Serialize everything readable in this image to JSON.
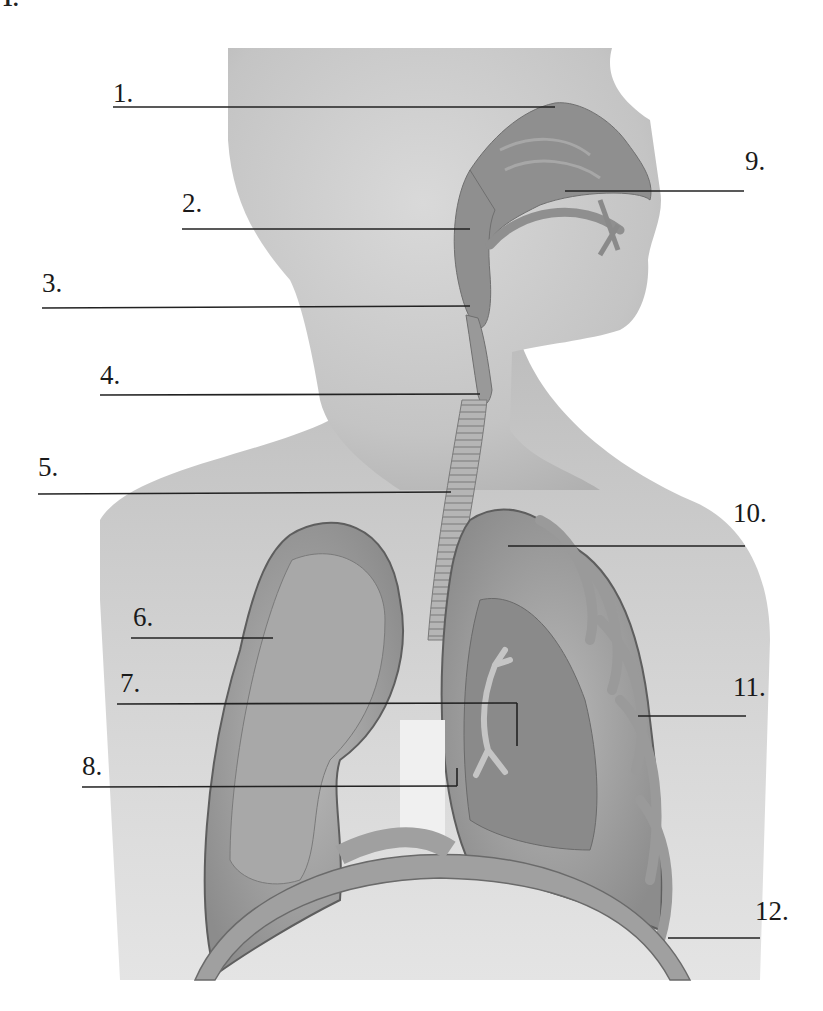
{
  "diagram": {
    "corner_mark": "1.",
    "colors": {
      "background": "#ffffff",
      "skin": "#c8c8c8",
      "skin_dark": "#a9a9a9",
      "airway": "#8e8e8e",
      "lung": "#a6a6a6",
      "lung_inner": "#8a8a8a",
      "line": "#222222"
    },
    "labels": [
      {
        "id": 1,
        "text": "1.",
        "x": 113,
        "y": 80,
        "line": {
          "x1": 113,
          "y1": 107,
          "x2": 555,
          "y2": 107
        }
      },
      {
        "id": 2,
        "text": "2.",
        "x": 182,
        "y": 190,
        "line": {
          "x1": 182,
          "y1": 229,
          "x2": 470,
          "y2": 229
        }
      },
      {
        "id": 3,
        "text": "3.",
        "x": 42,
        "y": 270,
        "line": {
          "x1": 42,
          "y1": 308,
          "x2": 470,
          "y2": 306
        }
      },
      {
        "id": 4,
        "text": "4.",
        "x": 100,
        "y": 362,
        "line": {
          "x1": 100,
          "y1": 395,
          "x2": 480,
          "y2": 394
        }
      },
      {
        "id": 5,
        "text": "5.",
        "x": 38,
        "y": 454,
        "line": {
          "x1": 38,
          "y1": 494,
          "x2": 451,
          "y2": 492
        }
      },
      {
        "id": 6,
        "text": "6.",
        "x": 133,
        "y": 604,
        "line": {
          "x1": 131,
          "y1": 638,
          "x2": 273,
          "y2": 638
        }
      },
      {
        "id": 7,
        "text": "7.",
        "x": 120,
        "y": 670,
        "line": {
          "x1": 117,
          "y1": 704,
          "x2": 517,
          "y2": 703
        }
      },
      {
        "id": 8,
        "text": "8.",
        "x": 82,
        "y": 753,
        "line": {
          "x1": 82,
          "y1": 787,
          "x2": 457,
          "y2": 786
        }
      },
      {
        "id": 9,
        "text": "9.",
        "x": 745,
        "y": 148,
        "line": {
          "x1": 565,
          "y1": 191,
          "x2": 744,
          "y2": 191
        }
      },
      {
        "id": 10,
        "text": "10.",
        "x": 733,
        "y": 500,
        "line": {
          "x1": 508,
          "y1": 546,
          "x2": 745,
          "y2": 546
        }
      },
      {
        "id": 11,
        "text": "11.",
        "x": 733,
        "y": 674,
        "line": {
          "x1": 638,
          "y1": 716,
          "x2": 746,
          "y2": 716
        }
      },
      {
        "id": 12,
        "text": "12.",
        "x": 755,
        "y": 898,
        "line": {
          "x1": 668,
          "y1": 938,
          "x2": 760,
          "y2": 938
        }
      }
    ],
    "leader_elbows": [
      {
        "for": 7,
        "x1": 517,
        "y1": 703,
        "x2": 517,
        "y2": 746
      },
      {
        "for": 8,
        "x1": 457,
        "y1": 786,
        "x2": 457,
        "y2": 768
      }
    ]
  }
}
